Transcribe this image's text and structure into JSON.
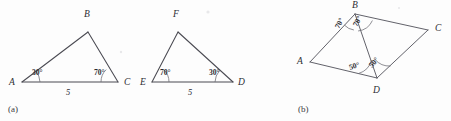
{
  "figure": {
    "background_color": "#fdfdfd",
    "line_color": "#4a4a52",
    "text_color": "#2c2c32",
    "panels": [
      {
        "id": "a",
        "caption": "(a)",
        "caption_x": 8,
        "caption_y": 112,
        "shapes": [
          {
            "name": "triangle-abc",
            "vertices": [
              {
                "label": "A",
                "x": 22,
                "y": 82,
                "label_x": 9,
                "label_y": 85
              },
              {
                "label": "B",
                "x": 88,
                "y": 32,
                "label_x": 84,
                "label_y": 17
              },
              {
                "label": "C",
                "x": 118,
                "y": 82,
                "label_x": 124,
                "label_y": 85
              }
            ],
            "angles": [
              {
                "at": "A",
                "value": "30°",
                "x": 32,
                "y": 75
              },
              {
                "at": "C",
                "value": "70°",
                "x": 94,
                "y": 75
              }
            ],
            "sides": [
              {
                "from": "A",
                "to": "C",
                "value": "5",
                "x": 68,
                "y": 95
              }
            ]
          },
          {
            "name": "triangle-efd",
            "vertices": [
              {
                "label": "E",
                "x": 152,
                "y": 82,
                "label_x": 140,
                "label_y": 85
              },
              {
                "label": "F",
                "x": 178,
                "y": 32,
                "label_x": 173,
                "label_y": 17
              },
              {
                "label": "D",
                "x": 233,
                "y": 82,
                "label_x": 238,
                "label_y": 85
              }
            ],
            "angles": [
              {
                "at": "E",
                "value": "70°",
                "x": 160,
                "y": 75
              },
              {
                "at": "D",
                "value": "30°",
                "x": 209,
                "y": 75
              }
            ],
            "sides": [
              {
                "from": "E",
                "to": "D",
                "value": "5",
                "x": 190,
                "y": 95
              }
            ]
          }
        ]
      },
      {
        "id": "b",
        "caption": "(b)",
        "caption_x": 298,
        "caption_y": 112,
        "shapes": [
          {
            "name": "quadrilateral-abcd",
            "vertices": [
              {
                "label": "A",
                "x": 310,
                "y": 62,
                "label_x": 297,
                "label_y": 64
              },
              {
                "label": "B",
                "x": 355,
                "y": 14,
                "label_x": 352,
                "label_y": 8
              },
              {
                "label": "C",
                "x": 428,
                "y": 30,
                "label_x": 435,
                "label_y": 31
              },
              {
                "label": "D",
                "x": 377,
                "y": 78,
                "label_x": 373,
                "label_y": 93
              }
            ],
            "diagonal": {
              "from": "B",
              "to": "D"
            },
            "angles": [
              {
                "at": "B",
                "region": "ABD",
                "value": "70°",
                "x": 339,
                "y": 29,
                "rotation": -62
              },
              {
                "at": "B",
                "region": "DBC",
                "value": "70°",
                "x": 357,
                "y": 27,
                "rotation": -62
              },
              {
                "at": "D",
                "region": "ADB",
                "value": "50°",
                "x": 350,
                "y": 70,
                "rotation": -18
              },
              {
                "at": "D",
                "region": "BDC",
                "value": "50°",
                "x": 372,
                "y": 68,
                "rotation": -48
              }
            ]
          }
        ]
      }
    ]
  }
}
